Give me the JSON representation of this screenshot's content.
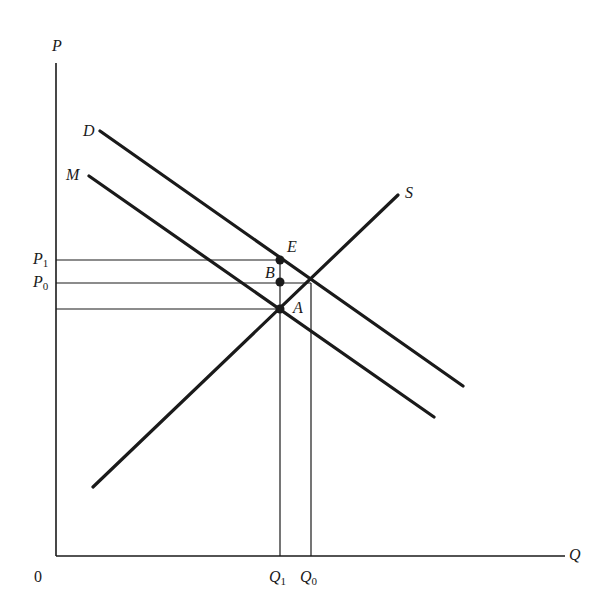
{
  "diagram": {
    "colors": {
      "ink": "#1a1a1a",
      "background": "#ffffff"
    },
    "axes": {
      "y_label": "P",
      "x_label": "Q",
      "origin_label": "0"
    },
    "curves": [
      {
        "id": "D",
        "label": "D",
        "description": "Demand curve",
        "from": [
          100,
          131
        ],
        "to": [
          463,
          386
        ]
      },
      {
        "id": "M",
        "label": "M",
        "description": "Marginal curve (shifted below demand)",
        "from": [
          89,
          176
        ],
        "to": [
          434,
          417
        ]
      },
      {
        "id": "S",
        "label": "S",
        "description": "Supply curve",
        "from": [
          93,
          487
        ],
        "to": [
          398,
          195
        ]
      }
    ],
    "points": [
      {
        "id": "E",
        "label": "E",
        "x": 280,
        "y": 260
      },
      {
        "id": "B",
        "label": "B",
        "x": 280,
        "y": 282
      },
      {
        "id": "A",
        "label": "A",
        "x": 280,
        "y": 309
      }
    ],
    "price_levels": [
      {
        "label": "P",
        "sub": "1",
        "y": 260
      },
      {
        "label": "P",
        "sub": "0",
        "y": 283
      },
      {
        "label": "",
        "sub": "",
        "y": 309
      }
    ],
    "quantity_levels": [
      {
        "label": "Q",
        "sub": "1",
        "x": 280
      },
      {
        "label": "Q",
        "sub": "0",
        "x": 311
      }
    ]
  }
}
